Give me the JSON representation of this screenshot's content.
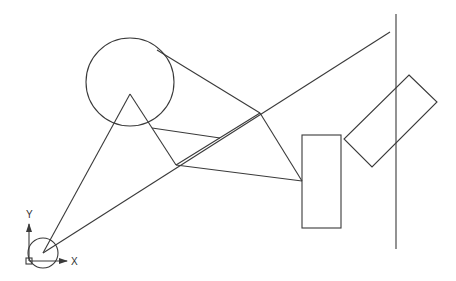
{
  "canvas": {
    "width": 456,
    "height": 281,
    "background": "#ffffff",
    "line_color": "#3a3a3a"
  },
  "ucs": {
    "x_label": "X",
    "y_label": "Y"
  },
  "shapes": {
    "large_circle": {
      "cx": 130,
      "cy": 82,
      "r": 44
    },
    "small_circle": {
      "cx": 43,
      "cy": 253,
      "r": 15
    },
    "vertical_line": {
      "x": 396,
      "y1": 14,
      "y2": 249
    },
    "rectangle": {
      "x": 302,
      "y": 135,
      "w": 39,
      "h": 93
    },
    "rotated_rectangle": "409,75 437,102 372,167 344,139"
  }
}
